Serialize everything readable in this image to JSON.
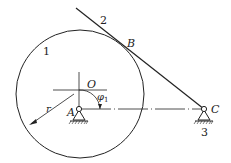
{
  "diagram": {
    "labels": {
      "link1": "1",
      "link2": "2",
      "link3": "3",
      "pointB": "B",
      "pointO": "O",
      "pointA": "A",
      "pointC": "C",
      "radius": "r",
      "angle_symbol": "φ",
      "angle_subscript": "1"
    },
    "colors": {
      "stroke": "#222222",
      "background": "#ffffff"
    }
  }
}
